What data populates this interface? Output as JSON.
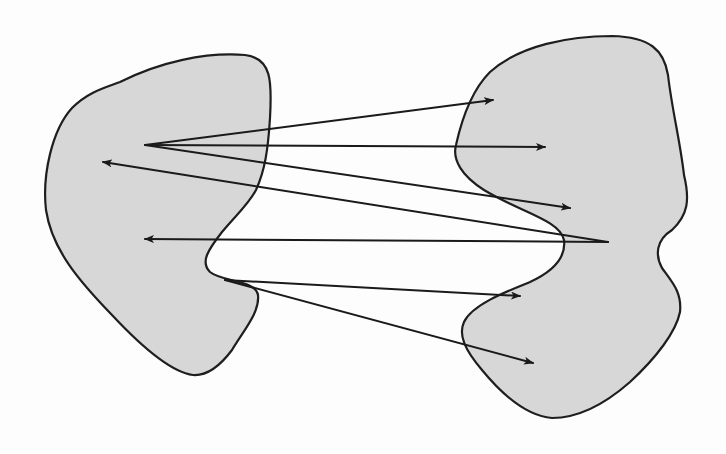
{
  "figure": {
    "colors": {
      "region_fill": "#d7d7d7",
      "outline": "#1e1e1e",
      "arrow": "#1a1a1a",
      "background": "#ffffff"
    },
    "regions": [
      {
        "id": "left-set",
        "path": "M 120 82 C 160 62, 205 52, 245 55 C 272 58, 272 82, 270 118 C 268 150, 265 170, 256 190 C 248 205, 236 215, 222 232 C 208 250, 200 262, 210 272 C 222 282, 256 280, 258 295 C 260 312, 244 330, 232 350 C 220 366, 206 376, 193 375 C 170 372, 140 345, 112 315 C 80 282, 52 250, 46 210 C 42 175, 52 130, 72 108 C 88 92, 104 88, 120 82 Z"
      },
      {
        "id": "right-set",
        "path": "M 490 72 C 520 45, 570 36, 612 36 C 650 37, 664 50, 668 75 C 672 110, 680 140, 684 175 C 690 200, 688 215, 672 230 C 656 240, 655 255, 662 268 C 672 282, 682 292, 680 312 C 676 332, 656 358, 630 382 C 605 404, 580 418, 552 418 C 528 416, 505 398, 482 370 C 465 350, 458 335, 464 322 C 472 305, 505 292, 530 282 C 556 270, 566 256, 564 240 C 560 220, 520 212, 484 190 C 462 176, 452 160, 456 145 C 462 118, 472 90, 490 72 Z"
      }
    ],
    "arrows": [
      {
        "from": [
          145,
          145
        ],
        "to": [
          493,
          100
        ]
      },
      {
        "from": [
          145,
          145
        ],
        "to": [
          545,
          147
        ]
      },
      {
        "from": [
          145,
          145
        ],
        "to": [
          570,
          208
        ]
      },
      {
        "from": [
          608,
          242
        ],
        "to": [
          103,
          162
        ]
      },
      {
        "from": [
          608,
          242
        ],
        "to": [
          145,
          239
        ]
      },
      {
        "from": [
          225,
          280
        ],
        "to": [
          520,
          296
        ]
      },
      {
        "from": [
          225,
          280
        ],
        "to": [
          533,
          363
        ]
      }
    ]
  },
  "background_text": {
    "visible_fragment": "4.12"
  }
}
